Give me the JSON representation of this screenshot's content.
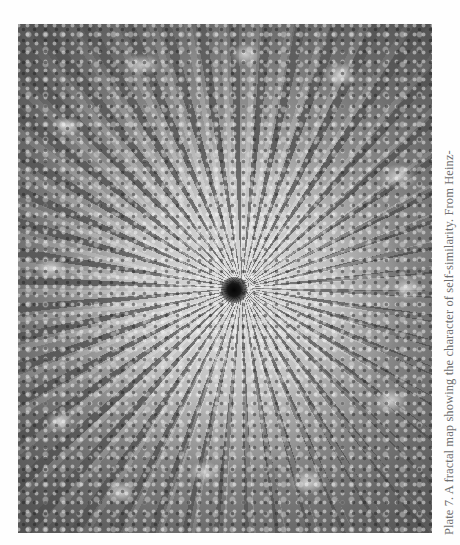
{
  "page": {
    "background": "#fefefe"
  },
  "plate": {
    "description": "grayscale fractal map with spiral center",
    "tones": {
      "outer": "#5a5a5a",
      "band": "#9a9a9a",
      "core": "#d8d8d8",
      "center": "#050505"
    }
  },
  "caption": {
    "text": "Plate 7. A fractal map showing the character of self-similarity. From Heinz-",
    "color": "#6f6f6f",
    "orientation": "rotated-90-ccw"
  }
}
